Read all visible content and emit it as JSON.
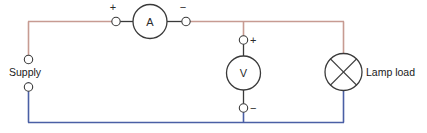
{
  "diagram": {
    "background_color": "#ffffff",
    "wire_colors": {
      "positive_line": "#c79b92",
      "negative_line": "#4a5fa5",
      "component_stroke": "#3a3a3a",
      "terminal_stroke": "#3a3a3a"
    },
    "labels": {
      "supply": "Supply",
      "lamp_load": "Lamp load"
    },
    "components": [
      {
        "id": "ammeter",
        "symbol": "A",
        "name": "ammeter",
        "terminal_left_sign": "+",
        "terminal_right_sign": "−"
      },
      {
        "id": "voltmeter",
        "symbol": "V",
        "name": "voltmeter",
        "terminal_top_sign": "+",
        "terminal_bottom_sign": "−"
      },
      {
        "id": "lamp",
        "symbol": "",
        "name": "lamp load",
        "label": "Lamp load"
      }
    ],
    "terminals": {
      "supply_positive": "",
      "supply_negative": ""
    }
  }
}
